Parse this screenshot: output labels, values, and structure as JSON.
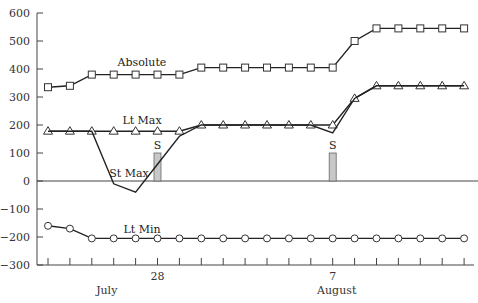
{
  "chart_data": {
    "type": "line",
    "title": "",
    "xlabel": "",
    "ylabel": "",
    "ylim": [
      -300,
      600
    ],
    "yticks": [
      600,
      500,
      400,
      300,
      200,
      100,
      0,
      -100,
      -200,
      -300
    ],
    "grid": false,
    "legend": "inline labels",
    "x_count": 20,
    "x_tick_labels": [
      {
        "index": 5,
        "label": "28",
        "month": "July"
      },
      {
        "index": 13,
        "label": "7",
        "month": "August"
      }
    ],
    "month_labels": [
      {
        "label": "July",
        "center_index": 2.5
      },
      {
        "label": "August",
        "center_index": 13
      }
    ],
    "series": [
      {
        "name": "Absolute",
        "marker": "square",
        "values": [
          335,
          340,
          380,
          380,
          380,
          380,
          380,
          405,
          405,
          405,
          405,
          405,
          405,
          405,
          500,
          545,
          545,
          545,
          545,
          545
        ],
        "label_index": 5
      },
      {
        "name": "Lt Max",
        "marker": "triangle",
        "values": [
          178,
          178,
          178,
          178,
          178,
          178,
          178,
          200,
          200,
          200,
          200,
          200,
          200,
          200,
          295,
          340,
          340,
          340,
          340,
          340
        ],
        "label_index": 5
      },
      {
        "name": "St Max",
        "marker": "none",
        "values": [
          178,
          178,
          178,
          -10,
          -40,
          60,
          160,
          200,
          200,
          200,
          200,
          200,
          200,
          172,
          295,
          340,
          340,
          340,
          340,
          340
        ],
        "label_index": 4
      },
      {
        "name": "Lt Min",
        "marker": "circle",
        "values": [
          -160,
          -170,
          -205,
          -205,
          -205,
          -205,
          -205,
          -205,
          -205,
          -205,
          -205,
          -205,
          -205,
          -205,
          -205,
          -205,
          -205,
          -205,
          -205,
          -205
        ],
        "label_index": 5
      }
    ],
    "bars": [
      {
        "label": "S",
        "index": 5,
        "value": 100
      },
      {
        "label": "S",
        "index": 13,
        "value": 100
      }
    ],
    "zero_line": true
  }
}
